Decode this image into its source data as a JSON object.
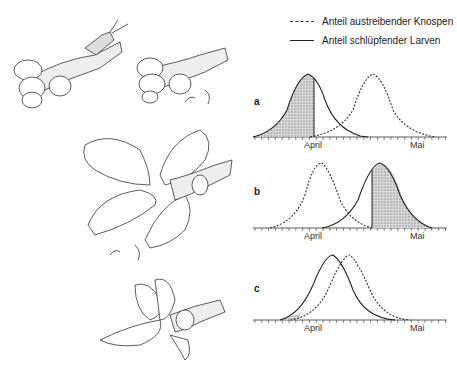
{
  "legend": {
    "items": [
      {
        "label": "Anteil austreibender Knospen",
        "style": "dashed"
      },
      {
        "label": "Anteil schlüpfender Larven",
        "style": "solid"
      }
    ]
  },
  "panels": [
    {
      "id": "a",
      "label": "a",
      "x_labels": [
        "April",
        "Mai"
      ]
    },
    {
      "id": "b",
      "label": "b",
      "x_labels": [
        "April",
        "Mai"
      ]
    },
    {
      "id": "c",
      "label": "c",
      "x_labels": [
        "April",
        "Mai"
      ]
    }
  ],
  "illustrations": [
    "Oak twig with buds and egg-laying moth",
    "Oak twig with buds and hatched larvae",
    "Oak twig with unfolded leaves and larvae",
    "Oak twig with damaged leaves and feeding larvae"
  ],
  "chart_data": [
    {
      "type": "line",
      "panel": "a",
      "x_labels": [
        "April",
        "Mai"
      ],
      "series": [
        {
          "name": "Anteil schlüpfender Larven",
          "style": "solid",
          "peak_x": "April",
          "shaded": "left of ~April+1 day"
        },
        {
          "name": "Anteil austreibender Knospen",
          "style": "dashed",
          "peak_x": "mid-April (~15 days after April)"
        }
      ]
    },
    {
      "type": "line",
      "panel": "b",
      "x_labels": [
        "April",
        "Mai"
      ],
      "series": [
        {
          "name": "Anteil austreibender Knospen",
          "style": "dashed",
          "peak_x": "April"
        },
        {
          "name": "Anteil schlüpfender Larven",
          "style": "solid",
          "peak_x": "~20 days after April",
          "shaded": "right of ~18 days after April"
        }
      ]
    },
    {
      "type": "line",
      "panel": "c",
      "x_labels": [
        "April",
        "Mai"
      ],
      "series": [
        {
          "name": "Anteil schlüpfender Larven",
          "style": "solid",
          "peak_x": "~4 days after April"
        },
        {
          "name": "Anteil austreibender Knospen",
          "style": "dashed",
          "peak_x": "~10 days after April",
          "shaded": "small tail before April"
        }
      ]
    }
  ]
}
